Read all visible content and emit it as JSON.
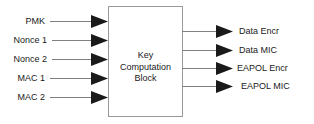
{
  "diagram": {
    "title": "Key Computation Block",
    "block": {
      "label_lines": [
        "Key",
        "Computation",
        "Block"
      ],
      "label_line1": "Key",
      "label_line2": "Computation",
      "label_line3": "Block",
      "border_color": "#999999",
      "fill_color": "#ffffff"
    },
    "arrow_color": "#1a1a1a",
    "line_color": "#808080",
    "inputs": [
      {
        "label": "PMK",
        "y": 21
      },
      {
        "label": "Nonce 1",
        "y": 40
      },
      {
        "label": "Nonce 2",
        "y": 59
      },
      {
        "label": "MAC 1",
        "y": 78
      },
      {
        "label": "MAC 2",
        "y": 97
      }
    ],
    "outputs": [
      {
        "label": "Data Encr",
        "y": 31
      },
      {
        "label": "Data MIC",
        "y": 50
      },
      {
        "label": "EAPOL Encr",
        "y": 68
      },
      {
        "label": "EAPOL MIC",
        "y": 86
      }
    ]
  }
}
